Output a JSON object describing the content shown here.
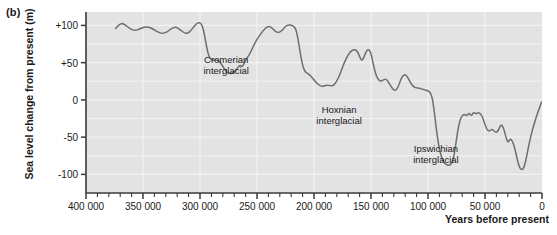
{
  "figure": {
    "panel_label": "(b)",
    "ylabel": "Sea level change from present (m)",
    "xlabel": "Years before present",
    "plot_bg": "#e3e3e3",
    "grid_color": "#f2f2f2",
    "line_color": "#6e6e6e",
    "axis_color": "#3a3a3a",
    "text_color": "#1a1a1a"
  },
  "chart_data": {
    "type": "line",
    "title": "",
    "xlabel": "Years before present",
    "ylabel": "Sea level change from present (m)",
    "xlim": [
      400000,
      0
    ],
    "ylim": [
      -125,
      118
    ],
    "x_reversed": true,
    "grid": true,
    "legend": null,
    "x_ticks": [
      400000,
      350000,
      300000,
      250000,
      200000,
      150000,
      100000,
      50000,
      0
    ],
    "x_tick_labels": [
      "400 000",
      "350 000",
      "300 000",
      "250 000",
      "200 000",
      "150 000",
      "100 000",
      "50 000",
      "0"
    ],
    "x_minor_tick_interval": 10000,
    "y_ticks": [
      100,
      50,
      0,
      -50,
      -100
    ],
    "y_tick_labels": [
      "+100",
      "+50",
      "0",
      "-50",
      "-100"
    ],
    "y_gridline_interval": 25,
    "series": [
      {
        "name": "Sea level change",
        "color": "#6e6e6e",
        "points": [
          [
            374000,
            96
          ],
          [
            371000,
            101
          ],
          [
            368000,
            103
          ],
          [
            365000,
            100
          ],
          [
            361000,
            95
          ],
          [
            357000,
            93
          ],
          [
            353000,
            95
          ],
          [
            349000,
            98
          ],
          [
            345000,
            98
          ],
          [
            341000,
            95
          ],
          [
            337000,
            91
          ],
          [
            333000,
            89
          ],
          [
            329000,
            91
          ],
          [
            325000,
            96
          ],
          [
            321000,
            98
          ],
          [
            318000,
            95
          ],
          [
            314000,
            90
          ],
          [
            311000,
            89
          ],
          [
            308000,
            93
          ],
          [
            305000,
            99
          ],
          [
            302000,
            104
          ],
          [
            299000,
            103
          ],
          [
            297000,
            95
          ],
          [
            295000,
            78
          ],
          [
            293000,
            62
          ],
          [
            291000,
            55
          ],
          [
            289000,
            53
          ],
          [
            286000,
            54
          ],
          [
            283000,
            52
          ],
          [
            280000,
            45
          ],
          [
            277000,
            38
          ],
          [
            274000,
            35
          ],
          [
            271000,
            36
          ],
          [
            268000,
            41
          ],
          [
            265000,
            47
          ],
          [
            263000,
            44
          ],
          [
            261000,
            50
          ],
          [
            259000,
            56
          ],
          [
            257000,
            60
          ],
          [
            255000,
            66
          ],
          [
            252000,
            76
          ],
          [
            249000,
            84
          ],
          [
            246000,
            90
          ],
          [
            243000,
            96
          ],
          [
            240000,
            99
          ],
          [
            237000,
            97
          ],
          [
            234000,
            92
          ],
          [
            231000,
            90
          ],
          [
            228000,
            93
          ],
          [
            225000,
            99
          ],
          [
            222000,
            101
          ],
          [
            219000,
            100
          ],
          [
            216000,
            96
          ],
          [
            214000,
            82
          ],
          [
            212000,
            62
          ],
          [
            210000,
            46
          ],
          [
            208000,
            38
          ],
          [
            206000,
            36
          ],
          [
            204000,
            34
          ],
          [
            201000,
            29
          ],
          [
            198000,
            23
          ],
          [
            195000,
            19
          ],
          [
            192000,
            18
          ],
          [
            189000,
            20
          ],
          [
            186000,
            19
          ],
          [
            183000,
            19
          ],
          [
            180000,
            25
          ],
          [
            177000,
            35
          ],
          [
            174000,
            48
          ],
          [
            171000,
            58
          ],
          [
            168000,
            65
          ],
          [
            165000,
            68
          ],
          [
            162000,
            66
          ],
          [
            160000,
            58
          ],
          [
            158000,
            52
          ],
          [
            156000,
            58
          ],
          [
            154000,
            66
          ],
          [
            152000,
            68
          ],
          [
            150000,
            63
          ],
          [
            148000,
            48
          ],
          [
            146000,
            35
          ],
          [
            144000,
            28
          ],
          [
            142000,
            25
          ],
          [
            140000,
            26
          ],
          [
            138000,
            28
          ],
          [
            136000,
            27
          ],
          [
            134000,
            22
          ],
          [
            132000,
            17
          ],
          [
            130000,
            13
          ],
          [
            128000,
            13
          ],
          [
            126000,
            18
          ],
          [
            124000,
            27
          ],
          [
            122000,
            33
          ],
          [
            120000,
            34
          ],
          [
            118000,
            31
          ],
          [
            116000,
            25
          ],
          [
            114000,
            20
          ],
          [
            112000,
            17
          ],
          [
            110000,
            16
          ],
          [
            108000,
            16
          ],
          [
            106000,
            15
          ],
          [
            104000,
            14
          ],
          [
            102000,
            13
          ],
          [
            100000,
            12
          ],
          [
            98000,
            10
          ],
          [
            96000,
            2
          ],
          [
            94000,
            -22
          ],
          [
            92000,
            -48
          ],
          [
            90000,
            -66
          ],
          [
            88000,
            -78
          ],
          [
            86000,
            -84
          ],
          [
            84000,
            -87
          ],
          [
            82000,
            -88
          ],
          [
            80000,
            -87
          ],
          [
            78000,
            -81
          ],
          [
            76000,
            -64
          ],
          [
            74000,
            -42
          ],
          [
            72000,
            -27
          ],
          [
            70000,
            -21
          ],
          [
            68000,
            -19
          ],
          [
            66000,
            -22
          ],
          [
            64000,
            -17
          ],
          [
            62000,
            -22
          ],
          [
            60000,
            -16
          ],
          [
            58000,
            -19
          ],
          [
            56000,
            -17
          ],
          [
            54000,
            -18
          ],
          [
            52000,
            -24
          ],
          [
            50000,
            -33
          ],
          [
            48000,
            -41
          ],
          [
            46000,
            -42
          ],
          [
            44000,
            -39
          ],
          [
            42000,
            -42
          ],
          [
            40000,
            -44
          ],
          [
            38000,
            -40
          ],
          [
            36000,
            -33
          ],
          [
            34000,
            -36
          ],
          [
            32000,
            -48
          ],
          [
            30000,
            -58
          ],
          [
            28000,
            -52
          ],
          [
            26000,
            -55
          ],
          [
            24000,
            -64
          ],
          [
            22000,
            -78
          ],
          [
            20000,
            -90
          ],
          [
            18000,
            -94
          ],
          [
            16000,
            -92
          ],
          [
            14000,
            -80
          ],
          [
            12000,
            -64
          ],
          [
            10000,
            -50
          ],
          [
            8000,
            -38
          ],
          [
            6000,
            -28
          ],
          [
            4000,
            -18
          ],
          [
            2000,
            -10
          ],
          [
            500,
            -3
          ]
        ]
      }
    ],
    "annotations": [
      {
        "text_line1": "Cromerian",
        "text_line2": "interglacial",
        "x": 277000,
        "y": 47
      },
      {
        "text_line1": "Hoxnian",
        "text_line2": "interglacial",
        "x": 178000,
        "y": -20
      },
      {
        "text_line1": "Ipswichian",
        "text_line2": "interglacial",
        "x": 93000,
        "y": -72
      }
    ]
  }
}
